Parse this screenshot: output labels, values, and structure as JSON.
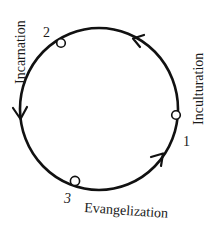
{
  "diagram": {
    "type": "cycle",
    "direction": "counter-clockwise",
    "line_color": "#111111",
    "node_fill": "#ffffff",
    "nodes": [
      {
        "id": "1",
        "number": "1",
        "label": "Inculturation"
      },
      {
        "id": "2",
        "number": "2",
        "label": "Incarnation"
      },
      {
        "id": "3",
        "number": "3",
        "label": "Evangelization"
      }
    ],
    "edges": [
      {
        "from": "1",
        "to": "2"
      },
      {
        "from": "2",
        "to": "3"
      },
      {
        "from": "3",
        "to": "1"
      }
    ]
  }
}
